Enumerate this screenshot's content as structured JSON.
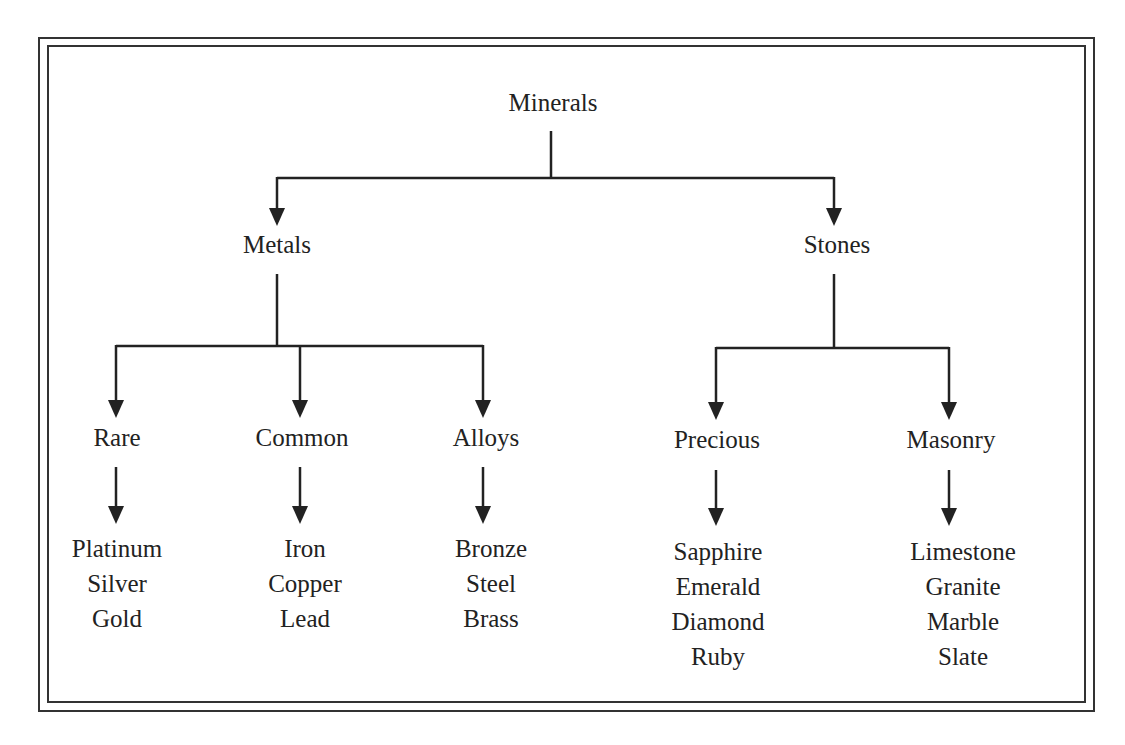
{
  "diagram": {
    "type": "tree",
    "root": "Minerals",
    "level1": [
      "Metals",
      "Stones"
    ],
    "level2": {
      "Metals": [
        "Rare",
        "Common",
        "Alloys"
      ],
      "Stones": [
        "Precious",
        "Masonry"
      ]
    },
    "leaves": {
      "Rare": [
        "Platinum",
        "Silver",
        "Gold"
      ],
      "Common": [
        "Iron",
        "Copper",
        "Lead"
      ],
      "Alloys": [
        "Bronze",
        "Steel",
        "Brass"
      ],
      "Precious": [
        "Sapphire",
        "Emerald",
        "Diamond",
        "Ruby"
      ],
      "Masonry": [
        "Limestone",
        "Granite",
        "Marble",
        "Slate"
      ]
    }
  },
  "labels": {
    "root": "Minerals",
    "metals": "Metals",
    "stones": "Stones",
    "rare": "Rare",
    "common": "Common",
    "alloys": "Alloys",
    "precious": "Precious",
    "masonry": "Masonry",
    "rare_items": [
      "Platinum",
      "Silver",
      "Gold"
    ],
    "common_items": [
      "Iron",
      "Copper",
      "Lead"
    ],
    "alloys_items": [
      "Bronze",
      "Steel",
      "Brass"
    ],
    "precious_items": [
      "Sapphire",
      "Emerald",
      "Diamond",
      "Ruby"
    ],
    "masonry_items": [
      "Limestone",
      "Granite",
      "Marble",
      "Slate"
    ]
  },
  "colors": {
    "line": "#222222",
    "border": "#333333",
    "background": "#ffffff"
  }
}
